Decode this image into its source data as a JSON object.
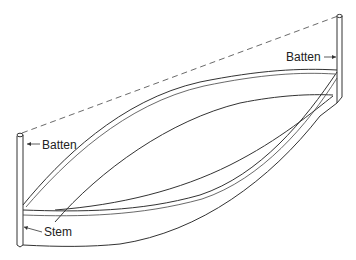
{
  "diagram": {
    "labels": {
      "batten_left": "Batten",
      "batten_right": "Batten",
      "stem": "Stem"
    },
    "colors": {
      "line": "#333333",
      "text": "#222222",
      "background": "#ffffff"
    }
  }
}
